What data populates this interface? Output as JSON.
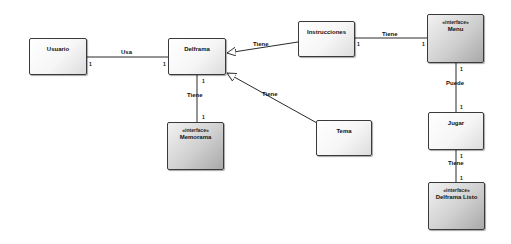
{
  "diagram": {
    "type": "uml-class-diagram",
    "classes": [
      {
        "id": "usuario",
        "name": "Usuario",
        "stereotype": "",
        "interface": false
      },
      {
        "id": "delframa",
        "name": "Delframa",
        "stereotype": "",
        "interface": false
      },
      {
        "id": "instrucciones",
        "name": "Instrucciones",
        "stereotype": "",
        "interface": false
      },
      {
        "id": "menu",
        "name": "Menu",
        "stereotype": "«interface»",
        "interface": true
      },
      {
        "id": "memorama",
        "name": "Memorama",
        "stereotype": "«interface»",
        "interface": true
      },
      {
        "id": "tema",
        "name": "Tema",
        "stereotype": "",
        "interface": false
      },
      {
        "id": "jugar",
        "name": "Jugar",
        "stereotype": "",
        "interface": false
      },
      {
        "id": "delframa_listo",
        "name": "Delframa Listo",
        "stereotype": "«interface»",
        "interface": true
      }
    ],
    "relations": [
      {
        "from": "usuario",
        "to": "delframa",
        "label": "Usa",
        "from_mult": "1",
        "to_mult": "1",
        "kind": "association"
      },
      {
        "from": "instrucciones",
        "to": "delframa",
        "label": "Tiene",
        "kind": "generalization"
      },
      {
        "from": "tema",
        "to": "delframa",
        "label": "Tiene",
        "kind": "generalization"
      },
      {
        "from": "delframa",
        "to": "memorama",
        "label": "Tiene",
        "from_mult": "1",
        "to_mult": "1",
        "kind": "association"
      },
      {
        "from": "instrucciones",
        "to": "menu",
        "label": "Tiene",
        "from_mult": "1",
        "to_mult": "1",
        "kind": "association"
      },
      {
        "from": "menu",
        "to": "jugar",
        "label": "Puede",
        "from_mult": "1",
        "to_mult": "1",
        "kind": "association"
      },
      {
        "from": "jugar",
        "to": "delframa_listo",
        "label": "Tiene",
        "from_mult": "1",
        "to_mult": "1",
        "kind": "association"
      }
    ]
  },
  "colors": {
    "line": "#2a2a2a",
    "plain_fill": "#f6f6f6",
    "interface_fill": "#cfcfcf"
  }
}
